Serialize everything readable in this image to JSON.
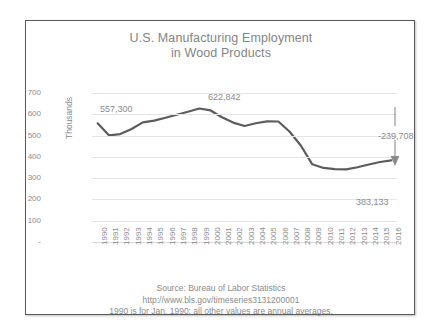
{
  "chart_data": {
    "type": "line",
    "title": "U.S. Manufacturing Employment in Wood Products",
    "title_lines": [
      "U.S. Manufacturing Employment",
      "in Wood Products"
    ],
    "xlabel": "",
    "ylabel": "Thousands",
    "ylim": [
      0,
      700
    ],
    "ytick_labels": [
      "700",
      "600",
      "500",
      "400",
      "300",
      "200",
      "100",
      "-"
    ],
    "ytick_values": [
      700,
      600,
      500,
      400,
      300,
      200,
      100,
      0
    ],
    "grid": true,
    "legend": "none",
    "line_color": "#5c5c5c",
    "categories": [
      "1990",
      "1991",
      "1992",
      "1993",
      "1994",
      "1995",
      "1996",
      "1997",
      "1998",
      "1999",
      "2000",
      "2001",
      "2002",
      "2003",
      "2004",
      "2005",
      "2006",
      "2007",
      "2008",
      "2009",
      "2010",
      "2011",
      "2012",
      "2013",
      "2014",
      "2015",
      "2016"
    ],
    "values": [
      557.3,
      501.0,
      507.0,
      531.0,
      562.0,
      570.0,
      584.0,
      598.0,
      612.0,
      627.0,
      618.0,
      586.0,
      561.0,
      545.0,
      558.0,
      567.0,
      566.0,
      518.0,
      452.0,
      365.0,
      348.0,
      342.0,
      341.0,
      351.0,
      364.0,
      376.0,
      383.133
    ],
    "annotations": [
      {
        "name": "start-value",
        "text": "557,300",
        "year": "1990",
        "value": 557300
      },
      {
        "name": "peak-value",
        "text": "622,842",
        "year": "1999",
        "value": 622842
      },
      {
        "name": "net-change",
        "text": "-239,708",
        "value": -239708
      },
      {
        "name": "end-value",
        "text": "383,133",
        "year": "2016",
        "value": 383133
      }
    ]
  },
  "footer": {
    "lines": [
      "Source: Bureau of Labor Statistics",
      "http://www.bls.gov/timeseries3131200001",
      "1990 is for Jan. 1990; all other values are annual averages."
    ]
  },
  "colors": {
    "line": "#5c5c5c",
    "text": "#8b8b8b",
    "grid": "#e4e4e4",
    "frame": "#5a5a5a",
    "background": "#ffffff"
  }
}
